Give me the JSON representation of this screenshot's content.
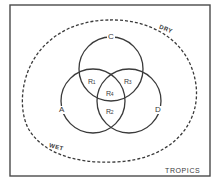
{
  "diagram": {
    "type": "venn",
    "frame_label": "TROPICS",
    "boundary": {
      "style": "dashed",
      "labels": {
        "dry": "DRY",
        "wet": "WET"
      }
    },
    "circles": [
      {
        "id": "A",
        "label": "A",
        "cx": 93,
        "cy": 101,
        "r": 32
      },
      {
        "id": "C",
        "label": "C",
        "cx": 111,
        "cy": 69,
        "r": 32
      },
      {
        "id": "D",
        "label": "D",
        "cx": 129,
        "cy": 101,
        "r": 32
      }
    ],
    "regions": [
      {
        "id": "R1",
        "label": "R",
        "sub": "1",
        "between": [
          "A",
          "C"
        ]
      },
      {
        "id": "R2",
        "label": "R",
        "sub": "2",
        "between": [
          "A",
          "D"
        ]
      },
      {
        "id": "R3",
        "label": "R",
        "sub": "3",
        "between": [
          "C",
          "D"
        ]
      },
      {
        "id": "R4",
        "label": "R",
        "sub": "4",
        "between": [
          "A",
          "C",
          "D"
        ]
      }
    ],
    "colors": {
      "line": "#3a3a3a",
      "background": "#ffffff"
    }
  }
}
